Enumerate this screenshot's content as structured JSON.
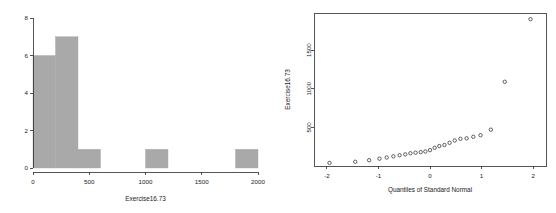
{
  "figure": {
    "panels": [
      "histogram",
      "qq-plot"
    ],
    "background": "#ffffff",
    "bar_color": "#a9a9a9",
    "axis_color": "#2b2b2b",
    "point_color": "#3a3a3a"
  },
  "chart_data": [
    {
      "type": "bar",
      "id": "histogram",
      "title": "",
      "xlabel": "Exercise16.73",
      "ylabel": "",
      "grid": false,
      "legend": null,
      "xlim": [
        0,
        2000
      ],
      "ylim": [
        0,
        8
      ],
      "xticks": [
        0,
        500,
        1000,
        1500,
        2000
      ],
      "xtick_labels": [
        "0",
        "500",
        "1000",
        "1500",
        "2000"
      ],
      "yticks": [
        0,
        2,
        4,
        6,
        8
      ],
      "ytick_labels": [
        "0",
        "2",
        "4",
        "6",
        "8"
      ],
      "bin_width": 200,
      "bin_edges": [
        0,
        200,
        400,
        600,
        800,
        1000,
        1200,
        1400,
        1600,
        1800,
        2000
      ],
      "categories": [
        "0-200",
        "200-400",
        "400-600",
        "600-800",
        "800-1000",
        "1000-1200",
        "1200-1400",
        "1400-1600",
        "1600-1800",
        "1800-2000"
      ],
      "values": [
        6,
        7,
        1,
        0,
        0,
        1,
        0,
        0,
        0,
        1
      ]
    },
    {
      "type": "scatter",
      "id": "qq-plot",
      "title": "",
      "xlabel": "Quantiles of Standard Normal",
      "ylabel": "Exercise16.73",
      "grid": false,
      "legend": null,
      "marker": "open-circle",
      "xlim": [
        -2.25,
        2.25
      ],
      "ylim": [
        0,
        1980
      ],
      "xticks": [
        -2,
        -1,
        0,
        1,
        2
      ],
      "xtick_labels": [
        "-2",
        "-1",
        "0",
        "1",
        "2"
      ],
      "yticks": [
        500,
        1000,
        1500
      ],
      "ytick_labels": [
        "500",
        "1000",
        "1500"
      ],
      "x": [
        -1.95,
        -1.45,
        -1.18,
        -0.98,
        -0.84,
        -0.71,
        -0.59,
        -0.48,
        -0.38,
        -0.28,
        -0.18,
        -0.09,
        0.0,
        0.09,
        0.18,
        0.28,
        0.38,
        0.48,
        0.59,
        0.71,
        0.84,
        0.98,
        1.18,
        1.45,
        1.95
      ],
      "y": [
        40,
        55,
        75,
        95,
        110,
        125,
        140,
        150,
        165,
        172,
        180,
        188,
        205,
        235,
        258,
        272,
        300,
        330,
        352,
        358,
        378,
        398,
        470,
        1090,
        1900
      ]
    }
  ],
  "histogram": {
    "name": "exercise-histogram",
    "xlabel": "Exercise16.73"
  },
  "qq": {
    "name": "normal-qq-plot",
    "xlabel": "Quantiles of Standard Normal",
    "ylabel": "Exercise16.73"
  }
}
